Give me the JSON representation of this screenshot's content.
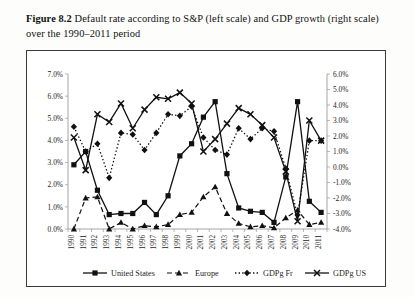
{
  "caption": {
    "label": "Figure 8.2",
    "text": "Default rate according to S&P (left scale) and GDP growth (right scale) over the 1990–2011 period"
  },
  "chart_data": {
    "type": "line",
    "title": "Default rate according to S&P (left scale) and GDP growth (right scale) over the 1990–2011 period",
    "xlabel": "",
    "ylabel": "",
    "grid": false,
    "legend_position": "bottom",
    "categories": [
      "1990",
      "1991",
      "1992",
      "1993",
      "1994",
      "1995",
      "1996",
      "1997",
      "1998",
      "1999",
      "2000",
      "2001",
      "2002",
      "2003",
      "2004",
      "2005",
      "2006",
      "2007",
      "2008",
      "2009",
      "2010",
      "2011"
    ],
    "left_axis": {
      "label": "",
      "ticks": [
        "0.0%",
        "1.0%",
        "2.0%",
        "3.0%",
        "4.0%",
        "5.0%",
        "6.0%",
        "7.0%"
      ],
      "min": 0.0,
      "max": 7.0,
      "step": 1.0
    },
    "right_axis": {
      "label": "",
      "ticks": [
        "-4.0%",
        "-3.0%",
        "-2.0%",
        "-1.0%",
        "0.0%",
        "1.0%",
        "2.0%",
        "3.0%",
        "4.0%",
        "5.0%",
        "6.0%"
      ],
      "min": -4.0,
      "max": 6.0,
      "step": 1.0
    },
    "series": [
      {
        "name": "United States",
        "axis": "left",
        "marker": "square",
        "dash": "solid",
        "values": [
          2.9,
          3.5,
          1.75,
          0.65,
          0.7,
          0.7,
          1.2,
          0.65,
          1.5,
          3.3,
          3.85,
          5.05,
          5.75,
          2.5,
          0.95,
          0.8,
          0.75,
          0.3,
          2.35,
          5.75,
          1.25,
          0.75
        ]
      },
      {
        "name": "Europe",
        "axis": "left",
        "marker": "triangle",
        "dash": "dashed",
        "values": [
          0.0,
          1.4,
          1.45,
          0.0,
          0.3,
          0.0,
          0.15,
          0.1,
          0.2,
          0.65,
          0.75,
          1.45,
          1.9,
          0.7,
          0.25,
          0.1,
          0.15,
          0.05,
          0.5,
          0.85,
          0.2,
          0.3
        ]
      },
      {
        "name": "GDPg Fr",
        "axis": "right",
        "marker": "diamond",
        "dash": "dotted",
        "values": [
          2.6,
          1.0,
          1.5,
          -0.7,
          2.2,
          2.1,
          1.1,
          2.2,
          3.4,
          3.3,
          3.9,
          1.9,
          1.1,
          0.8,
          2.5,
          1.8,
          2.5,
          2.3,
          -0.1,
          -3.1,
          1.7,
          1.7
        ]
      },
      {
        "name": "GDPg US",
        "axis": "right",
        "marker": "cross",
        "dash": "solid",
        "values": [
          1.9,
          -0.2,
          3.4,
          2.9,
          4.1,
          2.5,
          3.7,
          4.5,
          4.4,
          4.8,
          4.1,
          1.0,
          1.8,
          2.8,
          3.8,
          3.4,
          2.7,
          1.9,
          -0.3,
          -3.5,
          3.0,
          1.7
        ]
      }
    ],
    "legend": [
      {
        "label": "United States",
        "marker": "square",
        "dash": "solid"
      },
      {
        "label": "Europe",
        "marker": "triangle",
        "dash": "dashed"
      },
      {
        "label": "GDPg Fr",
        "marker": "diamond",
        "dash": "dotted"
      },
      {
        "label": "GDPg US",
        "marker": "cross",
        "dash": "solid"
      }
    ],
    "colors": {
      "ink": "#111111",
      "axis": "#8f8f8f",
      "frame": "#3b3b3b"
    }
  }
}
